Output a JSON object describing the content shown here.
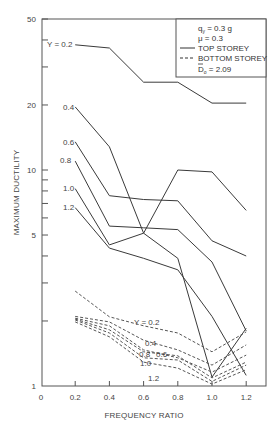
{
  "chart_data": {
    "type": "line",
    "title": "",
    "xlabel": "FREQUENCY RATIO",
    "ylabel": "MAXIMUM DUCTILITY",
    "x": [
      0.2,
      0.4,
      0.6,
      0.8,
      1.0,
      1.2
    ],
    "xlim": [
      0,
      1.3
    ],
    "x_ticks": [
      "0",
      "0.2",
      "0.4",
      "0.6",
      "0.8",
      "1.0",
      "1.2"
    ],
    "yscale": "log",
    "ylim": [
      1,
      50
    ],
    "y_ticks": [
      "1",
      "5",
      "10",
      "20",
      "50"
    ],
    "grid": false,
    "legend": {
      "position": "upper right",
      "lines": [
        "q_y = 0.3 g",
        "μ = 0.3",
        "TOP STOREY",
        "BOTTOM STOREY",
        "D̄_0 = 2.09"
      ],
      "entries": [
        {
          "label": "TOP STOREY",
          "style": "solid"
        },
        {
          "label": "BOTTOM STOREY",
          "style": "dashed"
        }
      ]
    },
    "series": [
      {
        "name": "Top storey, Y = 0.2",
        "style": "solid",
        "values": [
          38,
          36.7,
          25.5,
          25.5,
          20.4,
          20.4
        ]
      },
      {
        "name": "Top storey, Y = 0.4",
        "style": "solid",
        "values": [
          19.6,
          12.8,
          5.1,
          10,
          9.8,
          6.5
        ]
      },
      {
        "name": "Top storey, Y = 0.6",
        "style": "solid",
        "values": [
          13.5,
          7.6,
          7.3,
          7.2,
          4.7,
          4.0
        ]
      },
      {
        "name": "Top storey, Y = 0.8",
        "style": "solid",
        "values": [
          11,
          5.5,
          5.4,
          5.3,
          3.75,
          1.8
        ]
      },
      {
        "name": "Top storey, Y = 1.0",
        "style": "solid",
        "values": [
          8.2,
          4.5,
          5.1,
          3.9,
          1.1,
          1.85
        ]
      },
      {
        "name": "Top storey, Y = 1.2",
        "style": "solid",
        "values": [
          6.7,
          4.35,
          3.9,
          3.45,
          2.1,
          1.12
        ]
      },
      {
        "name": "Bottom storey, Y = 0.2",
        "style": "dashed",
        "values": [
          2.75,
          2.09,
          1.9,
          1.76,
          1.44,
          1.78
        ]
      },
      {
        "name": "Bottom storey, Y = 0.4",
        "style": "dashed",
        "values": [
          2.1,
          1.98,
          1.63,
          1.47,
          1.25,
          1.55
        ]
      },
      {
        "name": "Bottom storey, Y = 0.6",
        "style": "dashed",
        "values": [
          2.06,
          1.9,
          1.47,
          1.35,
          1.16,
          1.39
        ]
      },
      {
        "name": "Bottom storey, Y = 0.8",
        "style": "dashed",
        "values": [
          2.04,
          1.82,
          1.44,
          1.38,
          1.09,
          1.29
        ]
      },
      {
        "name": "Bottom storey, Y = 1.0",
        "style": "dashed",
        "values": [
          2.02,
          1.76,
          1.35,
          1.32,
          1.05,
          1.25
        ]
      },
      {
        "name": "Bottom storey, Y = 1.2",
        "style": "dashed",
        "values": [
          1.98,
          1.69,
          1.29,
          1.21,
          1.02,
          1.19
        ]
      }
    ],
    "annotations": {
      "top": [
        "Y = 0.2",
        "0.4",
        "0.6",
        "0.8",
        "1.0",
        "1.2"
      ],
      "bottom": [
        "Y = 0.2",
        "0.4",
        "0.8",
        "0.6",
        "1.0",
        "1.2"
      ]
    }
  }
}
